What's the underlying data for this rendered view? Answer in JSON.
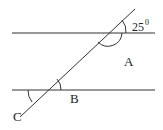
{
  "diagram": {
    "type": "parallel lines cut by a transversal",
    "labels": {
      "angle_given": "25",
      "degree_symbol": "0",
      "A": "A",
      "B": "B",
      "C": "C"
    },
    "colors": {
      "line": "#333333",
      "background": "#ffffff"
    }
  }
}
